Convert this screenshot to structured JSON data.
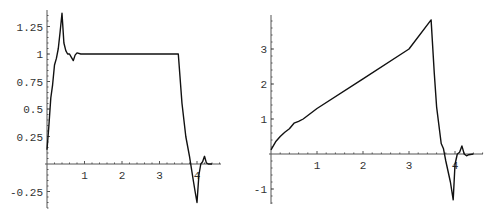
{
  "chart_data": [
    {
      "type": "line",
      "title": "",
      "xlabel": "",
      "ylabel": "",
      "xlim": [
        0,
        4.6
      ],
      "ylim": [
        -0.4,
        1.4
      ],
      "grid": false,
      "xticks": [
        1,
        2,
        3,
        4
      ],
      "xtick_labels": [
        "1",
        "2",
        "3",
        "4"
      ],
      "yticks": [
        -0.25,
        0.25,
        0.5,
        0.75,
        1,
        1.25
      ],
      "ytick_labels": [
        "-0.25",
        "0.25",
        "0.5",
        "0.75",
        "1",
        "1.25"
      ],
      "series": [
        {
          "name": "left-response",
          "x": [
            0,
            0.05,
            0.1,
            0.15,
            0.2,
            0.25,
            0.3,
            0.35,
            0.4,
            0.45,
            0.5,
            0.55,
            0.6,
            0.65,
            0.7,
            0.75,
            0.8,
            0.9,
            1.0,
            2.0,
            3.0,
            3.5,
            3.6,
            3.7,
            3.8,
            3.9,
            3.95,
            4.0,
            4.05,
            4.1,
            4.15,
            4.2,
            4.25,
            4.3,
            4.4
          ],
          "y": [
            0.13,
            0.35,
            0.6,
            0.72,
            0.9,
            0.96,
            1.05,
            1.2,
            1.37,
            1.1,
            1.03,
            1.0,
            1.0,
            0.97,
            0.94,
            0.99,
            1.01,
            1.0,
            1.0,
            1.0,
            1.0,
            1.0,
            0.55,
            0.25,
            0.07,
            -0.15,
            -0.25,
            -0.35,
            -0.1,
            0.0,
            0.02,
            0.07,
            0.01,
            0.0,
            0.0
          ]
        }
      ],
      "frame": {
        "ox": 47,
        "oy": 164,
        "sx": 37.5,
        "sy": 110,
        "x_axis_end": 221,
        "y_axis_top": 10,
        "y_axis_bottom": 208
      }
    },
    {
      "type": "line",
      "title": "",
      "xlabel": "",
      "ylabel": "",
      "xlim": [
        0,
        4.6
      ],
      "ylim": [
        -1.5,
        4.0
      ],
      "grid": false,
      "xticks": [
        1,
        2,
        3,
        4
      ],
      "xtick_labels": [
        "1",
        "2",
        "3",
        "4"
      ],
      "yticks": [
        -1,
        1,
        2,
        3
      ],
      "ytick_labels": [
        "-1",
        "1",
        "2",
        "3"
      ],
      "series": [
        {
          "name": "right-response",
          "x": [
            0,
            0.1,
            0.2,
            0.3,
            0.4,
            0.5,
            0.6,
            0.7,
            1.0,
            2.0,
            3.0,
            3.48,
            3.55,
            3.6,
            3.7,
            3.75,
            3.8,
            3.9,
            3.96,
            4.0,
            4.05,
            4.1,
            4.15,
            4.2,
            4.25,
            4.3,
            4.4
          ],
          "y": [
            0.12,
            0.35,
            0.5,
            0.62,
            0.72,
            0.88,
            0.93,
            1.0,
            1.3,
            2.15,
            3.0,
            3.83,
            2.3,
            1.35,
            0.3,
            0.15,
            -0.2,
            -0.8,
            -1.31,
            -0.3,
            0.0,
            0.05,
            0.23,
            0.0,
            -0.05,
            -0.02,
            0.0
          ]
        }
      ],
      "frame": {
        "ox": 271,
        "oy": 154,
        "sx": 46,
        "sy": 35,
        "x_axis_end": 483,
        "y_axis_top": 15,
        "y_axis_bottom": 204
      }
    }
  ]
}
